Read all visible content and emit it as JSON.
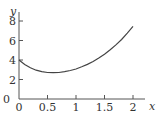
{
  "chart_data": {
    "type": "line",
    "title": "",
    "xlabel": "x",
    "ylabel": "y",
    "xlim": [
      0,
      2.2
    ],
    "ylim": [
      0,
      9
    ],
    "xticks": [
      0,
      0.5,
      1,
      1.5,
      2
    ],
    "xtick_labels": [
      "0",
      "0.5",
      "1",
      "1.5",
      "2"
    ],
    "yticks": [
      0,
      2,
      4,
      6,
      8
    ],
    "ytick_labels": [
      "0",
      "2",
      "4",
      "6",
      "8"
    ],
    "grid": false,
    "legend": null,
    "series": [
      {
        "name": "curve",
        "color": "#444444",
        "x": [
          0,
          0.1,
          0.2,
          0.3,
          0.4,
          0.5,
          0.6,
          0.7,
          0.8,
          0.9,
          1.0,
          1.1,
          1.2,
          1.3,
          1.4,
          1.5,
          1.6,
          1.7,
          1.8,
          1.9,
          2.0
        ],
        "y": [
          4.0,
          3.55,
          3.2,
          2.95,
          2.8,
          2.72,
          2.7,
          2.72,
          2.8,
          2.92,
          3.08,
          3.3,
          3.55,
          3.85,
          4.2,
          4.6,
          5.05,
          5.55,
          6.1,
          6.75,
          7.45
        ]
      }
    ]
  }
}
